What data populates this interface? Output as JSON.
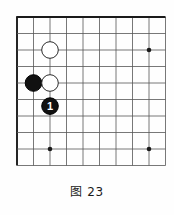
{
  "figure": {
    "caption": "图 23",
    "kind": "go-board-diagram"
  },
  "board": {
    "cols": 10,
    "rows": 10,
    "origin_x": 17,
    "origin_y": 17,
    "spacing": 16.5,
    "line_color": "#555555",
    "edge_color": "#1a1a1a",
    "line_width": 0.8,
    "edge_width": 1.9,
    "background": "#fefefe",
    "edges": {
      "top": true,
      "left": true,
      "right": false,
      "bottom": false
    }
  },
  "star_points": [
    {
      "name": "star-point-right",
      "col": 8,
      "row": 2,
      "radius": 2.3
    },
    {
      "name": "star-point-bottom-left",
      "col": 2,
      "row": 8,
      "radius": 2.3
    },
    {
      "name": "star-point-bottom-right",
      "col": 8,
      "row": 8,
      "radius": 2.3
    }
  ],
  "stones": [
    {
      "id": "white-stone-upper",
      "color": "white",
      "fill": "#ffffff",
      "stroke": "#2b2b2b",
      "col": 2,
      "row": 2,
      "radius": 8.3,
      "label": ""
    },
    {
      "id": "black-stone-left",
      "color": "black",
      "fill": "#111111",
      "stroke": "#000000",
      "col": 1,
      "row": 4,
      "radius": 8.3,
      "label": ""
    },
    {
      "id": "white-stone-lower",
      "color": "white",
      "fill": "#ffffff",
      "stroke": "#2b2b2b",
      "col": 2,
      "row": 4,
      "radius": 8.3,
      "label": ""
    },
    {
      "id": "black-stone-move-1",
      "color": "black",
      "fill": "#111111",
      "stroke": "#000000",
      "col": 2,
      "row": 5.4,
      "radius": 8.3,
      "label": "1",
      "label_color": "#ffffff"
    }
  ]
}
